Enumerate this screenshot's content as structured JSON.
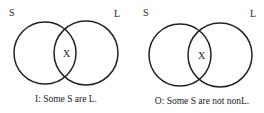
{
  "diagrams": [
    {
      "set_left_label": "S",
      "set_right_label": "L",
      "mark": "X",
      "caption": "I: Some S are L."
    },
    {
      "set_left_label": "S",
      "set_right_label": "L",
      "mark": "X",
      "caption": "O: Some S are not nonL."
    }
  ],
  "colors": {
    "stroke": "#222222",
    "background": "#ffffff"
  }
}
